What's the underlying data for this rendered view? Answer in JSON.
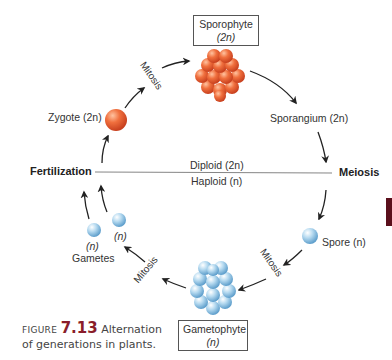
{
  "diagram": {
    "title": "Alternation of generations in plants",
    "nodes": {
      "sporophyte": {
        "label": "Sporophyte",
        "ploidy": "(2n)"
      },
      "sporangium": {
        "label": "Sporangium (2n)"
      },
      "meiosis": {
        "label": "Meiosis"
      },
      "spore": {
        "label": "Spore (n)"
      },
      "gametophyte": {
        "label": "Gametophyte",
        "ploidy": "(n)"
      },
      "gametes": {
        "label": "Gametes",
        "ploidy_a": "(n)",
        "ploidy_b": "(n)"
      },
      "fertilization": {
        "label": "Fertilization"
      },
      "zygote": {
        "label": "Zygote (2n)"
      }
    },
    "processes": {
      "mitosis_top": "Mitosis",
      "mitosis_right": "Mitosis",
      "mitosis_left": "Mitosis"
    },
    "divider": {
      "upper": "Diploid (2n)",
      "lower": "Haploid (n)"
    },
    "colors": {
      "diploid": "#e8603a",
      "haploid": "#a9d3ec",
      "arrow": "#222222",
      "accent": "#8a1d2a"
    }
  },
  "caption": {
    "prefix": "Figure",
    "number": "7.13",
    "line1": "Alternation",
    "line2": "of generations in plants."
  }
}
